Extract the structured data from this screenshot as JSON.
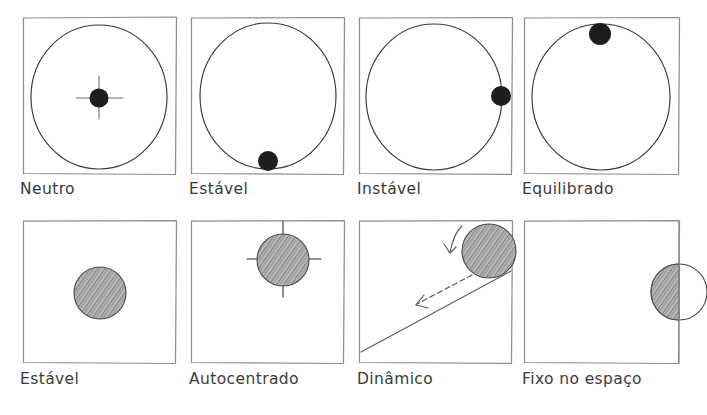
{
  "figure": {
    "kind": "hand-drawn-diagram",
    "language": "pt-BR",
    "background_color": "#ffffff",
    "ink_color": "#3a3a3a",
    "frame_color": "#8d8d8d",
    "caption_color": "#3b3b3b",
    "solid_ball_color": "#1d1d1d",
    "shaded_ball_color": "#8a8a8a",
    "rows": 2,
    "columns": 4
  },
  "panels": [
    {
      "id": "neutro",
      "caption": "Neutro",
      "row": 1,
      "column": 1,
      "contents": "large outline circle with a small solid black ball at the centre marked by a crosshair",
      "ball_style": "solid",
      "ball_position": "center",
      "has_crosshair": true,
      "has_outline_circle": true
    },
    {
      "id": "estavel",
      "caption": "Estável",
      "row": 1,
      "column": 2,
      "contents": "large outline circle with a small solid black ball resting at the bottom of the circle",
      "ball_style": "solid",
      "ball_position": "bottom",
      "has_crosshair": false,
      "has_outline_circle": true
    },
    {
      "id": "instavel",
      "caption": "Instável",
      "row": 1,
      "column": 3,
      "contents": "large outline circle with a small solid black ball balanced on the right side of the circle",
      "ball_style": "solid",
      "ball_position": "right",
      "has_crosshair": false,
      "has_outline_circle": true
    },
    {
      "id": "equilibrado",
      "caption": "Equilibrado",
      "row": 1,
      "column": 4,
      "contents": "large outline circle with a small solid black ball perched at the top of the circle",
      "ball_style": "solid",
      "ball_position": "top",
      "has_crosshair": false,
      "has_outline_circle": true
    },
    {
      "id": "estavel-2",
      "caption": "Estável",
      "row": 2,
      "column": 1,
      "contents": "empty frame with a single pencil-shaded disc sitting left of centre",
      "ball_style": "shaded",
      "ball_position": "center-left",
      "has_crosshair": false,
      "has_outline_circle": false
    },
    {
      "id": "autocentrado",
      "caption": "Autocentrado",
      "row": 2,
      "column": 2,
      "contents": "pencil-shaded disc in the upper area of the frame with a crosshair drawn through it",
      "ball_style": "shaded",
      "ball_position": "upper-center",
      "has_crosshair": true,
      "has_outline_circle": false
    },
    {
      "id": "dinamico",
      "caption": "Dinâmico",
      "row": 2,
      "column": 3,
      "contents": "inclined ramp rising from the lower-left to the upper-right corner, a pencil-shaded disc resting on the top of the ramp, a small curved arrow above the disc and a dashed arrow pointing down the slope",
      "ball_style": "shaded",
      "ball_position": "top-right-on-ramp",
      "has_crosshair": false,
      "has_outline_circle": false,
      "has_ramp": true,
      "arrows": [
        "curved-rotation-arrow",
        "dashed-motion-arrow"
      ]
    },
    {
      "id": "fixo-no-espaco",
      "caption": "Fixo no espaço",
      "row": 2,
      "column": 4,
      "contents": "disc straddling the right-hand frame edge; the half inside the frame is pencil-shaded and the half outside is an open outline",
      "ball_style": "half-shaded-on-edge",
      "ball_position": "right-edge",
      "has_crosshair": false,
      "has_outline_circle": true
    }
  ]
}
